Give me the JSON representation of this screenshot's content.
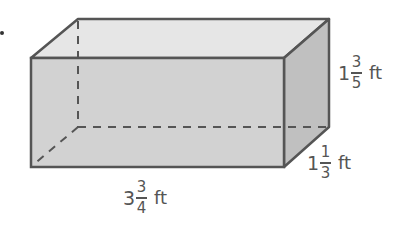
{
  "figure": {
    "type": "rectangular prism",
    "colors": {
      "top_face": "#e6e6e6",
      "front_face": "#d2d2d2",
      "side_face": "#c0c0c0",
      "edge": "#555555",
      "hidden_edge": "#555555"
    }
  },
  "labels": {
    "length": {
      "whole": "3",
      "numerator": "3",
      "denominator": "4",
      "unit": "ft"
    },
    "width": {
      "whole": "1",
      "numerator": "1",
      "denominator": "3",
      "unit": "ft"
    },
    "height": {
      "whole": "1",
      "numerator": "3",
      "denominator": "5",
      "unit": "ft"
    }
  }
}
